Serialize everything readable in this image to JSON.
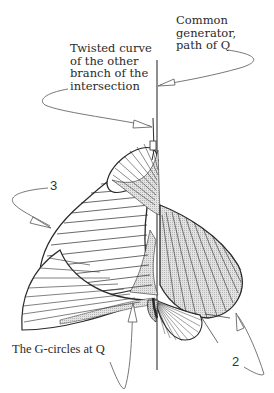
{
  "figure": {
    "type": "ruled-surface illustration",
    "annotations": {
      "common_generator": "Common\ngenerator,\npath of Q",
      "twisted_curve": "Twisted curve\nof the other\nbranch of the\nintersection",
      "g_circles": "The G-circles at Q",
      "label_3": "3",
      "label_2": "2"
    },
    "colors": {
      "line": "#2b2b2b",
      "shade": "#d6d6d6",
      "shade_dark": "#bdbdbd",
      "leader": "#555555"
    }
  }
}
